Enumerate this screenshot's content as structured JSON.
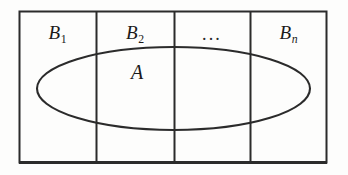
{
  "figure": {
    "background_color": "#fdfdfc",
    "stroke_color": "#2b2b2b",
    "outer_rect": {
      "x": 19,
      "y": 11,
      "width": 308,
      "height": 152
    },
    "dividers": [
      96,
      174,
      250
    ],
    "ellipse": {
      "cx": 173.5,
      "cy": 88.5,
      "rx": 136.5,
      "ry": 41.5
    },
    "columns": [
      {
        "name": "B1",
        "base": "B",
        "subscript": "1",
        "subscript_italic": false,
        "center_x": 57.5,
        "center_y": 33
      },
      {
        "name": "B2",
        "base": "B",
        "subscript": "2",
        "subscript_italic": false,
        "center_x": 135,
        "center_y": 33
      },
      {
        "name": "ellipsis",
        "base": "...",
        "subscript": "",
        "subscript_italic": false,
        "center_x": 212,
        "center_y": 33
      },
      {
        "name": "Bn",
        "base": "B",
        "subscript": "n",
        "subscript_italic": true,
        "center_x": 288.5,
        "center_y": 33
      }
    ],
    "set_label": {
      "text": "A",
      "center_x": 137,
      "center_y": 72
    }
  }
}
